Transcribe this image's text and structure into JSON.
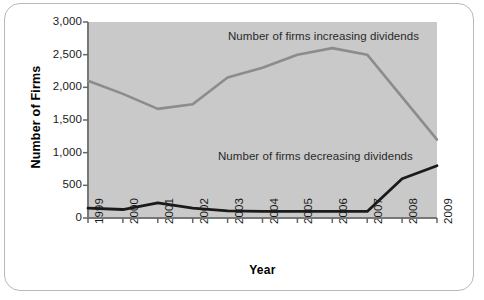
{
  "chart_data": {
    "type": "line",
    "title": "",
    "xlabel": "Year",
    "ylabel": "Number of Firms",
    "ylim": [
      0,
      3000
    ],
    "ytick_labels": [
      "3,000",
      "2,500",
      "2,000",
      "1,500",
      "1,000",
      "500",
      "0"
    ],
    "ytick_values": [
      3000,
      2500,
      2000,
      1500,
      1000,
      500,
      0
    ],
    "grid": false,
    "legend_position": "inline-annotations",
    "categories": [
      "1999",
      "2000",
      "2001",
      "2002",
      "2003",
      "2004",
      "2005",
      "2006",
      "2007",
      "2008",
      "2009"
    ],
    "series": [
      {
        "name": "Number of firms increasing dividends",
        "color": "#8c8c8c",
        "values": [
          2100,
          1900,
          1670,
          1740,
          2150,
          2300,
          2500,
          2600,
          2500,
          1850,
          1200
        ]
      },
      {
        "name": "Number of firms decreasing dividends",
        "color": "#1a1a1a",
        "values": [
          150,
          130,
          230,
          150,
          110,
          100,
          100,
          100,
          100,
          600,
          800
        ]
      }
    ],
    "annotations": [
      {
        "text": "Number of firms increasing dividends"
      },
      {
        "text": "Number of firms decreasing dividends"
      }
    ]
  },
  "colors": {
    "plot_background": "#c9c9c9",
    "card_border": "#b9b9b9",
    "axis": "#555555",
    "increasing_line": "#8c8c8c",
    "decreasing_line": "#1a1a1a"
  }
}
